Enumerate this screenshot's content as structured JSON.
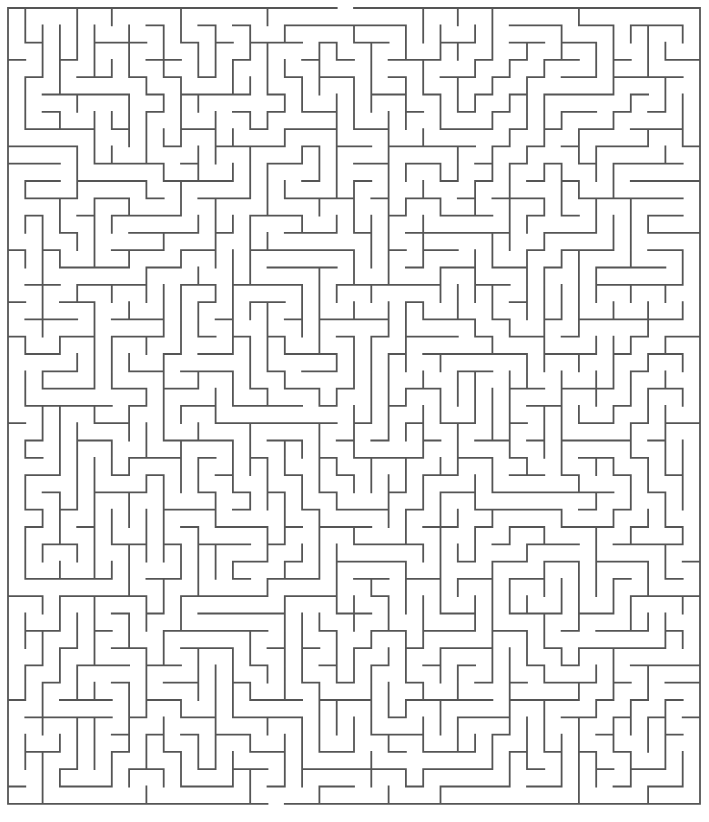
{
  "page": {
    "width": 709,
    "height": 822,
    "background_color": "#ffffff"
  },
  "maze": {
    "name": "rectangular-perfect-maze",
    "type": "orthogonal-grid-maze",
    "cols": 40,
    "rows": 46,
    "cell_size": 17.3,
    "origin_x": 8,
    "origin_y": 8,
    "wall_thickness": 1.8,
    "wall_color": "#555555",
    "background_color": "#ffffff",
    "entrance": {
      "side": "top",
      "col": 19,
      "label": "entrance"
    },
    "exit": {
      "side": "bottom",
      "col": 15,
      "label": "exit"
    },
    "seed": 20240517,
    "algorithm": "recursive-backtracker"
  }
}
